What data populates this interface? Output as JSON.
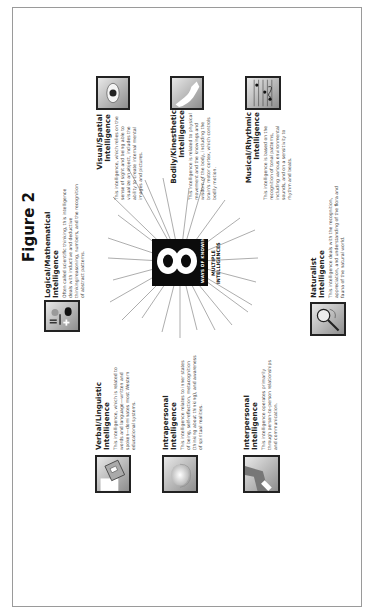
{
  "figure": {
    "title": "Figure 2",
    "center": {
      "numeral": "8",
      "caption": "WAYS OF KNOWING",
      "label_line1": "MULTIPLE",
      "label_line2": "INTELLIGENCES"
    },
    "intelligences": [
      {
        "id": "logical",
        "title_line1": "Logical/Mathematical",
        "title_line2": "Intelligence",
        "body": "Often called scientific thinking, this intelligence deals with inductive and deductive thinking/reasoning, numbers, and the recognition of abstract patterns.",
        "icon": "math-symbols-icon"
      },
      {
        "id": "visual",
        "title_line1": "Visual/Spatial",
        "title_line2": "Intelligence",
        "body": "This intelligence, which relies on the sense of sight and being able to visualize an object, includes the ability to create internal mental images and pictures.",
        "icon": "eye-icon"
      },
      {
        "id": "bodily",
        "title_line1": "Bodily/Kinesthetic",
        "title_line2": "Intelligence",
        "body": "This intelligence is related to physical movement and the knowings and wisdom of the body, including the brain's motor cortex, which controls bodily motion.",
        "icon": "flexed-arm-icon"
      },
      {
        "id": "musical",
        "title_line1": "Musical/Rhythmic",
        "title_line2": "Intelligence",
        "body": "This intelligence is based on the recognition of tonal patterns, including various environmental sounds, and on a sensitivity to rhythm and beats.",
        "icon": "music-notes-icon"
      },
      {
        "id": "naturalist",
        "title_line1": "Naturalist",
        "title_line2": "Intelligence",
        "body": "This intelligence deals with the recognition, appreciation, and understanding of the flora and fauna of the natural world.",
        "icon": "magnifying-glass-icon"
      },
      {
        "id": "verbal",
        "title_line1": "Verbal/Linguistic",
        "title_line2": "Intelligence",
        "body": "This intelligence, which is related to words and language—written and spoken—dominates most Western educational systems.",
        "icon": "book-icon"
      },
      {
        "id": "intrapersonal",
        "title_line1": "Intrapersonal",
        "title_line2": "Intelligence",
        "body": "This intelligence relates to inner states of being, self-reflection, metacognition (thinking about thinking), and awareness of spiritual realities.",
        "icon": "head-silhouette-icon"
      },
      {
        "id": "interpersonal",
        "title_line1": "Interpersonal",
        "title_line2": "Intelligence",
        "body": "This intelligence operates primarily through person-to-person relationships and communication.",
        "icon": "handshake-icon"
      }
    ]
  }
}
